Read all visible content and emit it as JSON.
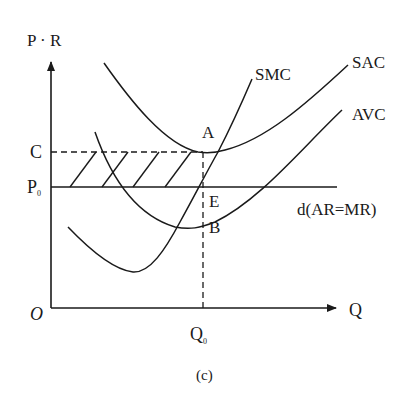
{
  "diagram": {
    "caption": "(c)",
    "axes": {
      "y_label": "P · R",
      "x_label": "Q",
      "origin_label": "O"
    },
    "levels": {
      "c_label": "C",
      "p0_label": "P",
      "p0_sub": "0",
      "q0_label": "Q",
      "q0_sub": "0"
    },
    "curves": {
      "smc": "SMC",
      "sac": "SAC",
      "avc": "AVC",
      "demand": "d(AR=MR)"
    },
    "points": {
      "a": "A",
      "e": "E",
      "b": "B"
    },
    "shaded_region": "loss rectangle between C and P0 from 0 to Q0"
  }
}
